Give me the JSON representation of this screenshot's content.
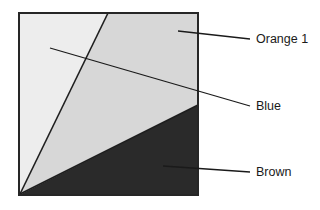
{
  "figure": {
    "background_color": "#ffffff"
  },
  "frame": {
    "name": "square-frame",
    "x": 19,
    "y": 13,
    "width": 179,
    "height": 182,
    "border_color": "#262626",
    "border_width": 2
  },
  "regions": [
    {
      "id": "region-left",
      "label": "Orange 1",
      "fill": "#ededed",
      "points": "19,13 108,13 19,195",
      "description": "light grey wedge on the left side"
    },
    {
      "id": "region-middle",
      "label": "Blue",
      "fill": "#d7d7d7",
      "points": "108,13 198,13 198,105 19,195",
      "description": "medium grey wedge in the middle"
    },
    {
      "id": "region-bottom",
      "label": "Brown",
      "fill": "#2a2a2a",
      "points": "198,105 198,195 19,195",
      "description": "dark triangle at the bottom right"
    }
  ],
  "divider_lines": [
    {
      "id": "divider-left",
      "x1": 20,
      "y1": 194,
      "x2": 108,
      "y2": 13,
      "color": "#1f1f1f",
      "width": 1.6
    },
    {
      "id": "divider-right",
      "x1": 20,
      "y1": 194,
      "x2": 198,
      "y2": 105,
      "color": "#1f1f1f",
      "width": 1.6
    }
  ],
  "callouts": [
    {
      "id": "callout-orange-1",
      "label": "Orange 1",
      "leader": {
        "x1": 178,
        "y1": 31,
        "x2": 250,
        "y2": 39
      },
      "text_x": 256,
      "text_y": 43,
      "color": "#1a1a1a"
    },
    {
      "id": "callout-blue",
      "label": "Blue",
      "leader": {
        "x1": 50,
        "y1": 48,
        "x2": 250,
        "y2": 106
      },
      "text_x": 256,
      "text_y": 110,
      "color": "#1a1a1a"
    },
    {
      "id": "callout-brown",
      "label": "Brown",
      "leader": {
        "x1": 163,
        "y1": 166,
        "x2": 250,
        "y2": 172
      },
      "text_x": 256,
      "text_y": 176,
      "color": "#1a1a1a"
    }
  ]
}
